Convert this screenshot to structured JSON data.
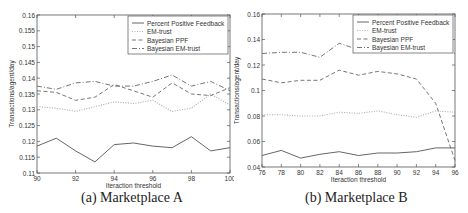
{
  "chart_data": [
    {
      "type": "line",
      "caption": "(a) Marketplace A",
      "title": "",
      "xlabel": "Iteraction threshold",
      "ylabel": "Transactions/agent/day",
      "xlim": [
        90,
        100
      ],
      "ylim": [
        0.11,
        0.16
      ],
      "xticks": [
        90,
        92,
        94,
        96,
        98,
        100
      ],
      "yticks": [
        0.11,
        0.115,
        0.12,
        0.125,
        0.13,
        0.135,
        0.14,
        0.145,
        0.15,
        0.155,
        0.16
      ],
      "grid": false,
      "legend_position": "upper right",
      "x": [
        90,
        91,
        92,
        93,
        94,
        95,
        96,
        97,
        98,
        99,
        100
      ],
      "series": [
        {
          "name": "Percent Positive Feedback",
          "style": "solid",
          "color": "#555555",
          "values": [
            0.1185,
            0.121,
            0.117,
            0.1135,
            0.119,
            0.1195,
            0.1185,
            0.118,
            0.1215,
            0.117,
            0.118
          ]
        },
        {
          "name": "EM-trust",
          "style": "dotted",
          "color": "#aaaaaa",
          "values": [
            0.131,
            0.1305,
            0.1295,
            0.131,
            0.1325,
            0.132,
            0.133,
            0.1295,
            0.1305,
            0.135,
            0.1315
          ]
        },
        {
          "name": "Bayesian PPF",
          "style": "dashed",
          "color": "#666666",
          "values": [
            0.136,
            0.1355,
            0.133,
            0.134,
            0.138,
            0.136,
            0.134,
            0.1385,
            0.135,
            0.1345,
            0.137
          ]
        },
        {
          "name": "Bayesian EM-trust",
          "style": "dashdot",
          "color": "#666666",
          "values": [
            0.1375,
            0.1365,
            0.1385,
            0.139,
            0.1375,
            0.1375,
            0.139,
            0.141,
            0.1375,
            0.139,
            0.136
          ]
        }
      ]
    },
    {
      "type": "line",
      "caption": "(b) Marketplace B",
      "title": "",
      "xlabel": "Iteraction threshold",
      "ylabel": "Transactions/agent/day",
      "xlim": [
        76,
        96
      ],
      "ylim": [
        0.04,
        0.16
      ],
      "xticks": [
        76,
        78,
        80,
        82,
        84,
        86,
        88,
        90,
        92,
        94,
        96
      ],
      "yticks": [
        0.04,
        0.06,
        0.08,
        0.1,
        0.12,
        0.14,
        0.16
      ],
      "grid": false,
      "legend_position": "upper right",
      "x": [
        76,
        78,
        80,
        82,
        84,
        86,
        88,
        90,
        92,
        94,
        96
      ],
      "series": [
        {
          "name": "Percent Positive Feedback",
          "style": "solid",
          "color": "#555555",
          "values": [
            0.049,
            0.053,
            0.047,
            0.05,
            0.052,
            0.049,
            0.051,
            0.051,
            0.052,
            0.055,
            0.055
          ]
        },
        {
          "name": "EM-trust",
          "style": "dotted",
          "color": "#aaaaaa",
          "values": [
            0.081,
            0.081,
            0.08,
            0.08,
            0.083,
            0.082,
            0.084,
            0.081,
            0.079,
            0.084,
            0.083
          ]
        },
        {
          "name": "Bayesian PPF",
          "style": "dashed",
          "color": "#666666",
          "values": [
            0.109,
            0.106,
            0.108,
            0.108,
            0.116,
            0.112,
            0.115,
            0.113,
            0.109,
            0.09,
            0.045
          ]
        },
        {
          "name": "Bayesian EM-trust",
          "style": "dashdot",
          "color": "#666666",
          "values": [
            0.129,
            0.13,
            0.13,
            0.126,
            0.137,
            0.132,
            0.134,
            0.133,
            0.136,
            0.134,
            0.129
          ]
        }
      ]
    }
  ]
}
